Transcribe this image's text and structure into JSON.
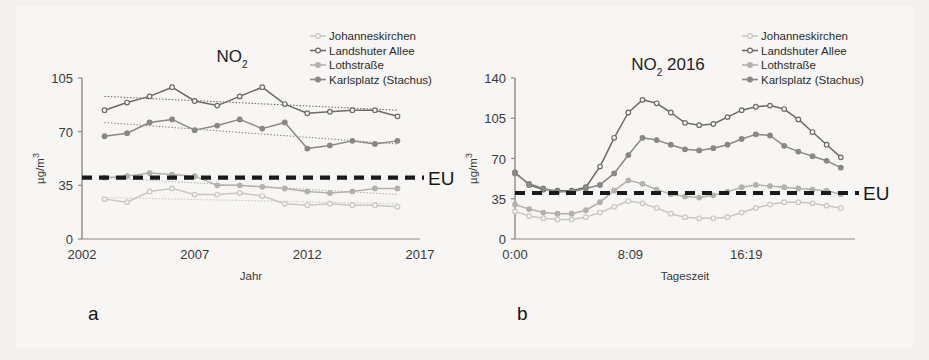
{
  "figure": {
    "background_color": "#f2f1ef",
    "paper_color": "#f7f6f4",
    "panel_a_letter": "a",
    "panel_b_letter": "b",
    "eu_limit_label": "EU",
    "eu_limit_value": 40,
    "eu_line_color": "#1a1a1a"
  },
  "series_style": {
    "johanneskirchen": {
      "color": "#c9c7c4",
      "marker": "open"
    },
    "landshuter_allee": {
      "color": "#6d6b69",
      "marker": "open"
    },
    "lothstrasse": {
      "color": "#b3b1ae",
      "marker": "filled"
    },
    "karlsplatz": {
      "color": "#8a8886",
      "marker": "filled"
    }
  },
  "legend": {
    "items": [
      {
        "key": "johanneskirchen",
        "label": "Johanneskirchen"
      },
      {
        "key": "landshuter_allee",
        "label": "Landshuter Allee"
      },
      {
        "key": "lothstrasse",
        "label": "Lothstraße"
      },
      {
        "key": "karlsplatz",
        "label": "Karlsplatz (Stachus)"
      }
    ]
  },
  "chart_data": [
    {
      "id": "panel-a",
      "type": "line",
      "title": "NO2",
      "title_main": "NO",
      "title_sub": "2",
      "xlabel": "Jahr",
      "ylabel": "µg/m3",
      "ylabel_main": "µg/m",
      "ylabel_sup": "3",
      "grid": false,
      "legend_position": "top-right",
      "xlim": [
        2002,
        2017
      ],
      "ylim": [
        0,
        105
      ],
      "xticks": [
        2002,
        2007,
        2012,
        2017
      ],
      "xticklabels": [
        "2002",
        "2007",
        "2012",
        "2017"
      ],
      "yticks": [
        0,
        35,
        70,
        105
      ],
      "yticklabels": [
        "0",
        "35",
        "70",
        "105"
      ],
      "x": [
        2003,
        2004,
        2005,
        2006,
        2007,
        2008,
        2009,
        2010,
        2011,
        2012,
        2013,
        2014,
        2015,
        2016
      ],
      "series": [
        {
          "name": "Johanneskirchen",
          "key": "johanneskirchen",
          "values": [
            26,
            24,
            31,
            33,
            29,
            29,
            30,
            28,
            23,
            22,
            23,
            22,
            22,
            21
          ]
        },
        {
          "name": "Landshuter Allee",
          "key": "landshuter_allee",
          "values": [
            84,
            89,
            93,
            99,
            90,
            87,
            93,
            99,
            88,
            82,
            83,
            84,
            84,
            80
          ]
        },
        {
          "name": "Lothstraße",
          "key": "lothstrasse",
          "values": [
            40,
            41,
            43,
            42,
            41,
            35,
            35,
            34,
            33,
            31,
            30,
            31,
            33,
            33
          ]
        },
        {
          "name": "Karlsplatz (Stachus)",
          "key": "karlsplatz",
          "values": [
            67,
            69,
            76,
            78,
            71,
            74,
            78,
            72,
            76,
            59,
            61,
            64,
            62,
            64,
            52
          ]
        }
      ],
      "trendlines": [
        {
          "key": "landshuter_allee",
          "x0": 2003,
          "y0": 93,
          "x1": 2016,
          "y1": 84,
          "style": "dotted"
        },
        {
          "key": "karlsplatz",
          "x0": 2003,
          "y0": 76,
          "x1": 2016,
          "y1": 62,
          "style": "dotted"
        },
        {
          "key": "lothstrasse",
          "x0": 2003,
          "y0": 40,
          "x1": 2016,
          "y1": 29,
          "style": "dotted"
        },
        {
          "key": "johanneskirchen",
          "x0": 2003,
          "y0": 27,
          "x1": 2016,
          "y1": 23,
          "style": "dotted"
        }
      ]
    },
    {
      "id": "panel-b",
      "type": "line",
      "title": "NO2 2016",
      "title_main": "NO",
      "title_sub": "2",
      "title_tail": " 2016",
      "xlabel": "Tageszeit",
      "ylabel": "µg/m3",
      "ylabel_main": "µg/m",
      "ylabel_sup": "3",
      "grid": false,
      "legend_position": "top-right",
      "xlim": [
        0,
        24
      ],
      "ylim": [
        0,
        140
      ],
      "xticks": [
        0,
        8.15,
        16.32
      ],
      "xticklabels": [
        "0:00",
        "8:09",
        "16:19"
      ],
      "yticks": [
        0,
        35,
        70,
        105,
        140
      ],
      "yticklabels": [
        "0",
        "35",
        "70",
        "105",
        "140"
      ],
      "x": [
        0,
        1,
        2,
        3,
        4,
        5,
        6,
        7,
        8,
        9,
        10,
        11,
        12,
        13,
        14,
        15,
        16,
        17,
        18,
        19,
        20,
        21,
        22,
        23
      ],
      "series": [
        {
          "name": "Johanneskirchen",
          "key": "johanneskirchen",
          "values": [
            24,
            20,
            18,
            17,
            17,
            19,
            23,
            28,
            33,
            31,
            27,
            22,
            19,
            18,
            18,
            19,
            23,
            27,
            30,
            32,
            32,
            31,
            29,
            27
          ]
        },
        {
          "name": "Landshuter Allee",
          "key": "landshuter_allee",
          "values": [
            58,
            47,
            43,
            42,
            42,
            45,
            63,
            88,
            110,
            121,
            118,
            110,
            101,
            99,
            100,
            106,
            112,
            115,
            116,
            113,
            104,
            93,
            82,
            71
          ]
        },
        {
          "name": "Lothstraße",
          "key": "lothstrasse",
          "values": [
            30,
            26,
            23,
            22,
            22,
            25,
            32,
            42,
            51,
            48,
            43,
            39,
            37,
            36,
            38,
            41,
            45,
            47,
            46,
            45,
            44,
            43,
            42,
            39
          ]
        },
        {
          "name": "Karlsplatz (Stachus)",
          "key": "karlsplatz",
          "values": [
            57,
            48,
            44,
            41,
            41,
            44,
            47,
            57,
            73,
            88,
            86,
            82,
            78,
            77,
            79,
            82,
            87,
            91,
            90,
            81,
            76,
            72,
            68,
            62
          ]
        }
      ],
      "trendlines": []
    }
  ]
}
